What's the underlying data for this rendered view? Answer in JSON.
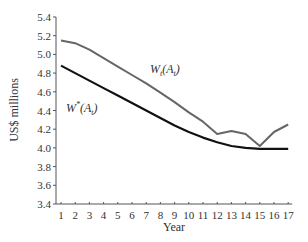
{
  "chart_data": {
    "type": "line",
    "title": "",
    "xlabel": "Year",
    "ylabel": "US$ millions",
    "x": [
      1,
      2,
      3,
      4,
      5,
      6,
      7,
      8,
      9,
      10,
      11,
      12,
      13,
      14,
      15,
      16,
      17
    ],
    "xticks": [
      "1",
      "2",
      "3",
      "4",
      "5",
      "6",
      "7",
      "8",
      "9",
      "10",
      "11",
      "12",
      "13",
      "14",
      "15",
      "16",
      "17"
    ],
    "yticks": [
      "3.4",
      "3.6",
      "3.8",
      "4.0",
      "4.2",
      "4.4",
      "4.6",
      "4.8",
      "5.0",
      "5.2",
      "5.4"
    ],
    "ylim": [
      3.4,
      5.4
    ],
    "xlim": [
      1,
      17
    ],
    "grid": false,
    "legend": "inline labels",
    "series": [
      {
        "name": "W_t(A_t)",
        "label_main": "W",
        "label_sub": "t",
        "label_paren": "(A",
        "label_paren_sub": "t",
        "label_close": ")",
        "color": "#666666",
        "values": [
          5.15,
          5.12,
          5.05,
          4.96,
          4.87,
          4.78,
          4.69,
          4.59,
          4.49,
          4.38,
          4.28,
          4.15,
          4.18,
          4.15,
          4.02,
          4.17,
          4.25
        ]
      },
      {
        "name": "W*(A_t)",
        "label_main": "W",
        "label_sup": "*",
        "label_paren": "(A",
        "label_paren_sub": "t",
        "label_close": ")",
        "color": "#111111",
        "values": [
          4.88,
          4.8,
          4.72,
          4.64,
          4.56,
          4.48,
          4.4,
          4.32,
          4.24,
          4.17,
          4.11,
          4.06,
          4.02,
          4.0,
          3.99,
          3.99,
          3.99
        ]
      }
    ]
  }
}
